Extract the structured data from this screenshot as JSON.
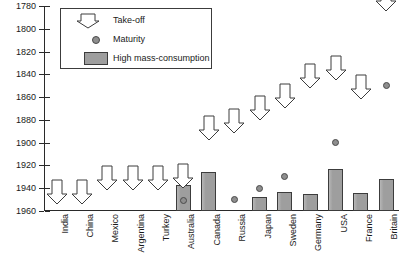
{
  "legend": {
    "items": [
      {
        "label": "Take-off",
        "icon": "down-arrow-outline"
      },
      {
        "label": "Maturity",
        "icon": "filled-circle"
      },
      {
        "label": "High mass-consumption",
        "icon": "gray-rectangle"
      }
    ]
  },
  "colors": {
    "bar_fill": "#9e9e9e",
    "bar_stroke": "#3c3c3c",
    "dot_fill": "#8e8e8e",
    "dot_stroke": "#4a4a4a",
    "axis": "#2a2a2a",
    "background": "#ffffff"
  },
  "chart_data": {
    "type": "bar",
    "title": "",
    "subtitle": "",
    "xlabel": "",
    "ylabel": "",
    "ylim": [
      1780,
      1960
    ],
    "y_inverted": true,
    "grid": false,
    "legend_position": "top-left",
    "yticks": [
      1780,
      1800,
      1820,
      1840,
      1860,
      1880,
      1900,
      1920,
      1940,
      1960
    ],
    "ytick_labels": [
      "1780",
      "1800",
      "1820",
      "1840",
      "1860",
      "1880",
      "1900",
      "1920",
      "1940",
      "1960"
    ],
    "categories": [
      "India",
      "China",
      "Mexico",
      "Argentina",
      "Turkey",
      "Australia",
      "Canada",
      "Russia",
      "Japan",
      "Sweden",
      "Germany",
      "USA",
      "France",
      "Britain"
    ],
    "series": [
      {
        "name": "Take-off",
        "marker": "down-arrow-outline",
        "values": [
          1952,
          1952,
          1940,
          1940,
          1940,
          1938,
          1896,
          1890,
          1878,
          1868,
          1850,
          1843,
          1860,
          1783
        ]
      },
      {
        "name": "Maturity",
        "marker": "filled-circle",
        "values": [
          null,
          null,
          null,
          null,
          null,
          1951,
          null,
          1950,
          1940,
          1930,
          null,
          1900,
          null,
          1850
        ]
      },
      {
        "name": "High mass-consumption",
        "marker": "bar",
        "values": [
          null,
          null,
          null,
          null,
          null,
          1937,
          1926,
          null,
          1948,
          1943,
          1945,
          1923,
          1944,
          1932
        ]
      }
    ]
  }
}
